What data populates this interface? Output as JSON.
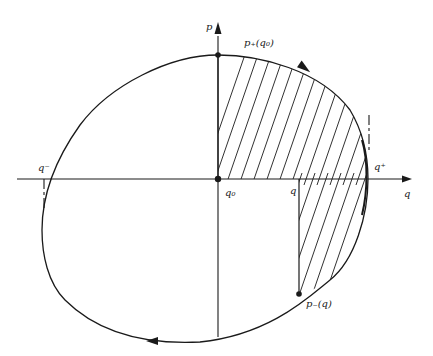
{
  "diagram": {
    "type": "phase-portrait",
    "axes": {
      "horizontal_label": "q",
      "vertical_label": "p"
    },
    "labels": {
      "p_plus_q0": "p₊(q₀)",
      "p_minus_q": "p₋(q)",
      "q0": "q₀",
      "q": "q",
      "q_plus": "q⁺",
      "q_minus": "q⁻"
    },
    "points": [
      {
        "name": "p_plus_q0",
        "x": 218,
        "y": 55
      },
      {
        "name": "q0",
        "x": 218,
        "y": 179
      },
      {
        "name": "p_minus_q",
        "x": 299,
        "y": 294
      }
    ],
    "region": "hatched area between q0 and q under the closed orbit",
    "colors": {
      "stroke": "#1a1a1a",
      "background": "#ffffff"
    }
  }
}
